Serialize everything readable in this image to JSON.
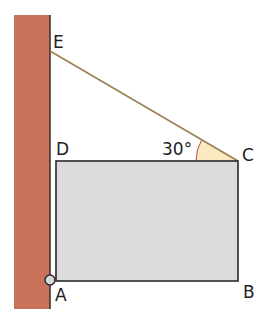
{
  "diagram": {
    "type": "geometry",
    "points": {
      "E": {
        "label": "E"
      },
      "D": {
        "label": "D"
      },
      "C": {
        "label": "C"
      },
      "B": {
        "label": "B"
      },
      "A": {
        "label": "A"
      }
    },
    "angle": {
      "at": "C",
      "between": [
        "CD",
        "CE"
      ],
      "label": "30°"
    },
    "colors": {
      "wall": "#c8735a",
      "wall_edge": "#3a2a22",
      "plate_fill": "#dcdcdc",
      "plate_stroke": "#2a2a2a",
      "cable": "#9a8050",
      "angle_fill": "#fbe9bf",
      "angle_arc": "#c0504d"
    }
  }
}
